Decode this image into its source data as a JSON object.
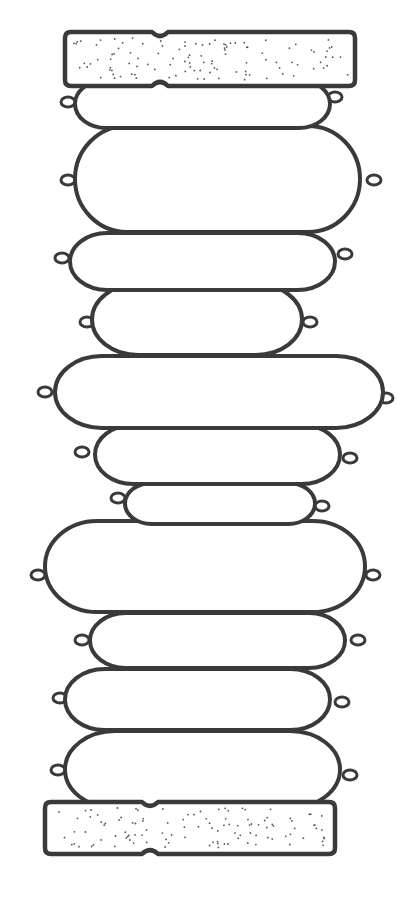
{
  "illustration": {
    "subject": "stack of sausages between two slices of bread",
    "style": "black ink line drawing on white",
    "colors": {
      "background": "#ffffff",
      "ink": "#3a3a3a"
    },
    "bread_top": {
      "x": 65,
      "y": 32,
      "w": 290,
      "h": 54,
      "notch_x": 160
    },
    "bread_bottom": {
      "x": 45,
      "y": 802,
      "w": 290,
      "h": 52,
      "notch_x": 150
    },
    "sausages": [
      {
        "x": 75,
        "y": 80,
        "w": 255,
        "h": 48,
        "tieL": [
          68,
          102
        ],
        "tieR": [
          335,
          97
        ]
      },
      {
        "x": 75,
        "y": 126,
        "w": 285,
        "h": 106,
        "tieL": [
          68,
          180
        ],
        "tieR": [
          374,
          180
        ]
      },
      {
        "x": 70,
        "y": 233,
        "w": 265,
        "h": 57,
        "tieL": [
          62,
          258
        ],
        "tieR": [
          345,
          254
        ]
      },
      {
        "x": 92,
        "y": 284,
        "w": 210,
        "h": 71,
        "tieL": [
          87,
          322
        ],
        "tieR": [
          310,
          322
        ]
      },
      {
        "x": 55,
        "y": 356,
        "w": 328,
        "h": 72,
        "tieL": [
          45,
          392
        ],
        "tieR": [
          386,
          398
        ]
      },
      {
        "x": 95,
        "y": 425,
        "w": 245,
        "h": 59,
        "tieL": [
          82,
          452
        ],
        "tieR": [
          350,
          458
        ]
      },
      {
        "x": 125,
        "y": 483,
        "w": 190,
        "h": 41,
        "tieL": [
          118,
          498
        ],
        "tieR": [
          322,
          506
        ]
      },
      {
        "x": 45,
        "y": 521,
        "w": 320,
        "h": 91,
        "tieL": [
          38,
          575
        ],
        "tieR": [
          373,
          575
        ]
      },
      {
        "x": 90,
        "y": 613,
        "w": 255,
        "h": 55,
        "tieL": [
          82,
          640
        ],
        "tieR": [
          358,
          640
        ]
      },
      {
        "x": 65,
        "y": 669,
        "w": 265,
        "h": 61,
        "tieL": [
          60,
          698
        ],
        "tieR": [
          342,
          702
        ]
      },
      {
        "x": 65,
        "y": 731,
        "w": 275,
        "h": 77,
        "tieL": [
          58,
          770
        ],
        "tieR": [
          350,
          775
        ]
      }
    ]
  }
}
